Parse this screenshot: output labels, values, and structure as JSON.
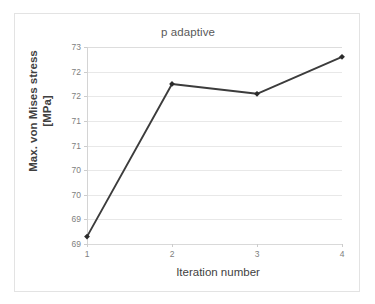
{
  "chart_data": {
    "type": "line",
    "title": "p adaptive",
    "xlabel": "Iteration number",
    "ylabel": "Max. von Mises stress [MPa]",
    "ylabel_lines": [
      "Max. von Mises stress",
      "[MPa]"
    ],
    "x": [
      1,
      2,
      3,
      4
    ],
    "values": [
      69.15,
      72.25,
      72.05,
      72.8
    ],
    "series": [
      {
        "name": "Max. von Mises stress",
        "values": [
          69.15,
          72.25,
          72.05,
          72.8
        ]
      }
    ],
    "categories": [
      "1",
      "2",
      "3",
      "4"
    ],
    "xlim": [
      1,
      4
    ],
    "ylim": [
      69,
      73
    ],
    "ytick_values": [
      69,
      69.5,
      70,
      70.5,
      71,
      71.5,
      72,
      72.5,
      73
    ],
    "ytick_labels": [
      "69",
      "69",
      "70",
      "70",
      "71",
      "71",
      "72",
      "72",
      "73"
    ],
    "xtick_labels": [
      "1",
      "2",
      "3",
      "4"
    ],
    "grid": "horizontal",
    "legend": "none",
    "marker": "diamond",
    "line_color": "#3c3c3c",
    "marker_color": "#2b2b2b",
    "gridline_color": "#e8e8e8",
    "axis_color": "#d4d4d4",
    "tick_label_color": "#808080",
    "title_color": "#595959",
    "axis_title_color": "#3f3f3f",
    "frame_color": "#e3e3e3",
    "background": "#ffffff"
  }
}
